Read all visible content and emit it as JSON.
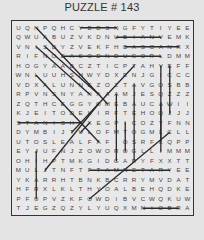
{
  "title": "PUZZLE # 143",
  "grid": {
    "rows": 20,
    "cols": 20,
    "letters": [
      [
        "U",
        "Q",
        "N",
        "P",
        "Q",
        "H",
        "C",
        "Y",
        "B",
        "D",
        "S",
        "N",
        "G",
        "F",
        "Y",
        "T",
        "I",
        "Y",
        "E",
        "E"
      ],
      [
        "Q",
        "W",
        "U",
        "A",
        "B",
        "U",
        "Z",
        "V",
        "K",
        "D",
        "N",
        "U",
        "B",
        "I",
        "A",
        "N",
        "V",
        "E",
        "M",
        "K"
      ],
      [
        "V",
        "N",
        "I",
        "S",
        "D",
        "Y",
        "Z",
        "V",
        "E",
        "K",
        "F",
        "H",
        "B",
        "A",
        "S",
        "O",
        "A",
        "N",
        "R",
        "X"
      ],
      [
        "R",
        "I",
        "F",
        "N",
        "O",
        "E",
        "A",
        "S",
        "O",
        "D",
        "N",
        "D",
        "U",
        "G",
        "O",
        "R",
        "L",
        "D",
        "M",
        "M"
      ],
      [
        "H",
        "O",
        "G",
        "Y",
        "A",
        "A",
        "B",
        "C",
        "Z",
        "T",
        "I",
        "C",
        "P",
        "T",
        "A",
        "H",
        "V",
        "E",
        "F",
        "F"
      ],
      [
        "W",
        "N",
        "L",
        "U",
        "U",
        "H",
        "S",
        "H",
        "W",
        "Y",
        "D",
        "X",
        "E",
        "N",
        "J",
        "G",
        "I",
        "C",
        "C",
        "C"
      ],
      [
        "V",
        "D",
        "X",
        "A",
        "L",
        "U",
        "N",
        "N",
        "E",
        "Z",
        "O",
        "Z",
        "T",
        "A",
        "V",
        "G",
        "O",
        "S",
        "B",
        "B"
      ],
      [
        "R",
        "P",
        "V",
        "N",
        "S",
        "N",
        "Y",
        "A",
        "N",
        "A",
        "A",
        "A",
        "M",
        "J",
        "E",
        "S",
        "Q",
        "Z",
        "Z",
        "Z"
      ],
      [
        "Z",
        "Q",
        "T",
        "H",
        "C",
        "E",
        "G",
        "G",
        "Y",
        "O",
        "M",
        "E",
        "B",
        "A",
        "U",
        "C",
        "A",
        "W",
        "I",
        "I"
      ],
      [
        "K",
        "J",
        "E",
        "I",
        "T",
        "O",
        "D",
        "E",
        "L",
        "I",
        "R",
        "F",
        "T",
        "E",
        "H",
        "O",
        "Q",
        "J",
        "J",
        "J"
      ],
      [
        "S",
        "T",
        "A",
        "N",
        "I",
        "S",
        "H",
        "A",
        "X",
        "E",
        "G",
        "P",
        "I",
        "C",
        "O",
        "Z",
        "Y",
        "F",
        "N",
        "N"
      ],
      [
        "D",
        "Y",
        "M",
        "B",
        "I",
        "J",
        "T",
        "U",
        "L",
        "O",
        "F",
        "M",
        "T",
        "O",
        "G",
        "M",
        "L",
        "C",
        "L",
        "L"
      ],
      [
        "U",
        "T",
        "O",
        "S",
        "L",
        "E",
        "A",
        "L",
        "F",
        "A",
        "F",
        "I",
        "O",
        "S",
        "R",
        "F",
        "L",
        "Q",
        "P",
        "P"
      ],
      [
        "E",
        "Y",
        "J",
        "U",
        "F",
        "N",
        "J",
        "Z",
        "O",
        "W",
        "O",
        "R",
        "O",
        "G",
        "L",
        "L",
        "I",
        "M",
        "M",
        "M"
      ],
      [
        "O",
        "H",
        "I",
        "H",
        "P",
        "T",
        "M",
        "K",
        "G",
        "I",
        "D",
        "G",
        "A",
        "R",
        "Y",
        "F",
        "X",
        "X",
        "T",
        "T"
      ],
      [
        "M",
        "U",
        "L",
        "J",
        "T",
        "N",
        "F",
        "T",
        "F",
        "T",
        "A",
        "M",
        "N",
        "E",
        "T",
        "A",
        "R",
        "Y",
        "E",
        "E"
      ],
      [
        "Y",
        "K",
        "A",
        "R",
        "R",
        "H",
        "T",
        "B",
        "N",
        "K",
        "B",
        "C",
        "R",
        "R",
        "Y",
        "M",
        "V",
        "D",
        "A",
        "T"
      ],
      [
        "H",
        "F",
        "R",
        "X",
        "L",
        "K",
        "L",
        "T",
        "H",
        "Y",
        "O",
        "A",
        "L",
        "B",
        "E",
        "H",
        "Q",
        "D",
        "K",
        "E"
      ],
      [
        "P",
        "F",
        "U",
        "P",
        "V",
        "Z",
        "K",
        "F",
        "O",
        "W",
        "D",
        "I",
        "B",
        "V",
        "C",
        "W",
        "Q",
        "K",
        "U",
        "W"
      ],
      [
        "T",
        "J",
        "E",
        "G",
        "Z",
        "Q",
        "Z",
        "Y",
        "L",
        "Y",
        "U",
        "Q",
        "X",
        "M",
        "N",
        "I",
        "O",
        "B",
        "R",
        "A"
      ]
    ]
  },
  "found_lines": [
    {
      "from": [
        0,
        7
      ],
      "to": [
        0,
        11
      ],
      "direction": "horizontal"
    },
    {
      "from": [
        1,
        11
      ],
      "to": [
        1,
        16
      ],
      "direction": "horizontal"
    },
    {
      "from": [
        2,
        12
      ],
      "to": [
        2,
        18
      ],
      "direction": "horizontal"
    },
    {
      "from": [
        3,
        5
      ],
      "to": [
        3,
        16
      ],
      "direction": "horizontal"
    },
    {
      "from": [
        10,
        0
      ],
      "to": [
        10,
        7
      ],
      "direction": "horizontal"
    },
    {
      "from": [
        15,
        8
      ],
      "to": [
        15,
        17
      ],
      "direction": "horizontal"
    },
    {
      "from": [
        19,
        14
      ],
      "to": [
        19,
        18
      ],
      "direction": "horizontal"
    },
    {
      "from": [
        0,
        2
      ],
      "to": [
        8,
        10
      ],
      "direction": "diagonal"
    },
    {
      "from": [
        2,
        2
      ],
      "to": [
        7,
        8
      ],
      "direction": "diagonal"
    },
    {
      "from": [
        2,
        3
      ],
      "to": [
        7,
        9
      ],
      "direction": "diagonal"
    },
    {
      "from": [
        5,
        2
      ],
      "to": [
        12,
        9
      ],
      "direction": "diagonal"
    },
    {
      "from": [
        4,
        13
      ],
      "to": [
        11,
        6
      ],
      "direction": "diagonal"
    },
    {
      "from": [
        8,
        9
      ],
      "to": [
        15,
        3
      ],
      "direction": "diagonal"
    },
    {
      "from": [
        10,
        8
      ],
      "to": [
        11,
        7
      ],
      "direction": "diagonal"
    },
    {
      "from": [
        11,
        17
      ],
      "to": [
        18,
        8
      ],
      "direction": "diagonal"
    },
    {
      "from": [
        4,
        16
      ],
      "to": [
        12,
        16
      ],
      "direction": "vertical"
    },
    {
      "from": [
        4,
        17
      ],
      "to": [
        9,
        17
      ],
      "direction": "vertical"
    },
    {
      "from": [
        6,
        13
      ],
      "to": [
        14,
        13
      ],
      "direction": "vertical"
    },
    {
      "from": [
        7,
        11
      ],
      "to": [
        14,
        11
      ],
      "direction": "vertical"
    },
    {
      "from": [
        8,
        16
      ],
      "to": [
        13,
        16
      ],
      "direction": "vertical"
    },
    {
      "from": [
        10,
        12
      ],
      "to": [
        13,
        12
      ],
      "direction": "vertical"
    },
    {
      "from": [
        13,
        2
      ],
      "to": [
        18,
        2
      ],
      "direction": "vertical"
    }
  ],
  "colors": {
    "background": "#e4e4e4",
    "board": "#e8e8e8",
    "border": "#333333",
    "text": "#444444",
    "line": "#2a2a2a"
  }
}
